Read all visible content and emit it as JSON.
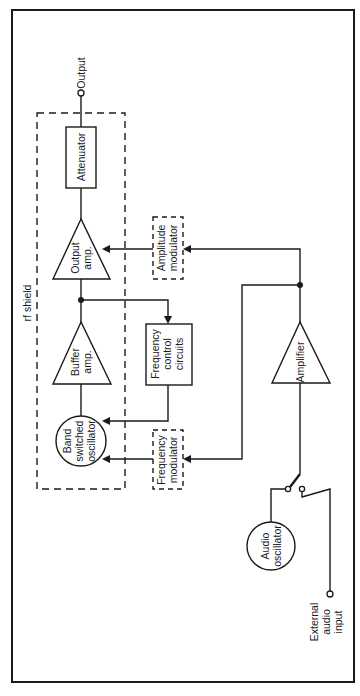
{
  "diagram": {
    "type": "block diagram (rotated 90°)",
    "labels": {
      "output": "Output",
      "attenuator": "Attenuator",
      "output_amp": [
        "Output",
        "amp."
      ],
      "buffer_amp": [
        "Buffer",
        "amp."
      ],
      "band_switched_oscillator": [
        "Band",
        "switched",
        "oscillator"
      ],
      "rf_shield": "rf shield",
      "amplitude_modulator": [
        "Amplitude",
        "modulator"
      ],
      "frequency_control": [
        "Frequency",
        "control",
        "circuits"
      ],
      "frequency_modulator": [
        "Frequency",
        "modulator"
      ],
      "amplifier": "Amplifier",
      "audio_oscillator": [
        "Audio",
        "oscillator"
      ],
      "external_audio_input": [
        "External",
        "audio",
        "input"
      ]
    },
    "colors": {
      "line": "#1a1a1a",
      "background": "#ffffff"
    },
    "connections": [
      {
        "from": "band_switched_oscillator",
        "to": "buffer_amp"
      },
      {
        "from": "buffer_amp",
        "to": "output_amp"
      },
      {
        "from": "buffer_amp",
        "to": "frequency_control"
      },
      {
        "from": "frequency_control",
        "to": "band_switched_oscillator"
      },
      {
        "from": "output_amp",
        "to": "attenuator"
      },
      {
        "from": "attenuator",
        "to": "output"
      },
      {
        "from": "amplifier",
        "to": "amplitude_modulator"
      },
      {
        "from": "amplitude_modulator",
        "to": "output_amp"
      },
      {
        "from": "amplifier",
        "to": "frequency_modulator"
      },
      {
        "from": "frequency_modulator",
        "to": "band_switched_oscillator"
      },
      {
        "from": "switch",
        "to": "amplifier"
      },
      {
        "from": "audio_oscillator",
        "to": "switch"
      },
      {
        "from": "external_audio_input",
        "to": "switch"
      }
    ]
  }
}
